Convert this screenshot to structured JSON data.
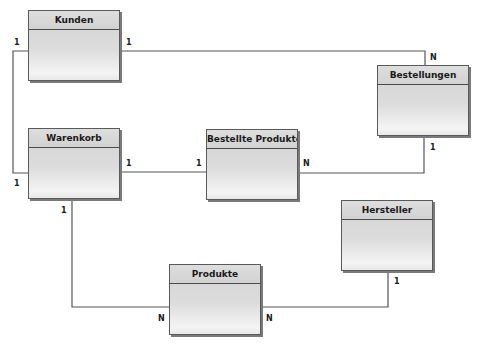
{
  "diagram": {
    "type": "entity-relationship",
    "line_color": "#555555",
    "entities": [
      {
        "id": "kunden",
        "name": "Kunden",
        "x": 28,
        "y": 10
      },
      {
        "id": "bestellungen",
        "name": "Bestellungen",
        "x": 377,
        "y": 65
      },
      {
        "id": "warenkorb",
        "name": "Warenkorb",
        "x": 28,
        "y": 128
      },
      {
        "id": "bestellte_produkte",
        "name": "Bestellte Produkte",
        "x": 206,
        "y": 129
      },
      {
        "id": "hersteller",
        "name": "Hersteller",
        "x": 341,
        "y": 200
      },
      {
        "id": "produkte",
        "name": "Produkte",
        "x": 169,
        "y": 264
      }
    ],
    "relationships": [
      {
        "from": "Kunden",
        "to": "Bestellungen",
        "from_card": "1",
        "to_card": "N"
      },
      {
        "from": "Kunden",
        "to": "Warenkorb",
        "from_card": "1",
        "to_card": "1"
      },
      {
        "from": "Warenkorb",
        "to": "Bestellte Produkte",
        "from_card": "1",
        "to_card": "1"
      },
      {
        "from": "Bestellte Produkte",
        "to": "Bestellungen",
        "from_card": "N",
        "to_card": "1"
      },
      {
        "from": "Warenkorb",
        "to": "Produkte",
        "from_card": "1",
        "to_card": "N"
      },
      {
        "from": "Produkte",
        "to": "Hersteller",
        "from_card": "N",
        "to_card": "1"
      }
    ],
    "labels": {
      "kunden_bestellungen_from": "1",
      "kunden_bestellungen_to": "N",
      "kunden_warenkorb_from": "1",
      "kunden_warenkorb_to": "1",
      "warenkorb_bp_from": "1",
      "warenkorb_bp_to": "1",
      "bp_bestellungen_from": "N",
      "bp_bestellungen_to": "1",
      "warenkorb_produkte_from": "1",
      "warenkorb_produkte_to": "N",
      "produkte_hersteller_from": "N",
      "produkte_hersteller_to": "1"
    }
  }
}
